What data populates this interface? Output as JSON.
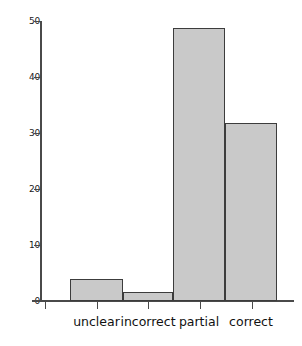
{
  "chart_data": {
    "type": "bar",
    "title": "",
    "xlabel": "",
    "ylabel": "",
    "categories": [
      "unclear",
      "incorrect",
      "partial",
      "correct"
    ],
    "values": [
      4.0,
      1.6,
      48.7,
      31.7
    ],
    "ylim": [
      0,
      50
    ],
    "yticks": [
      0,
      10,
      20,
      30,
      40,
      50
    ],
    "ytick_labels": [
      "0",
      "10",
      "20",
      "30",
      "40",
      "50"
    ],
    "grid": false,
    "legend": "none",
    "bar_fill_color": "#c9c9c9",
    "bar_edge_color": "#3c3c3c",
    "axis_color": "#4a4a4a",
    "background_color": "#ffffff"
  }
}
